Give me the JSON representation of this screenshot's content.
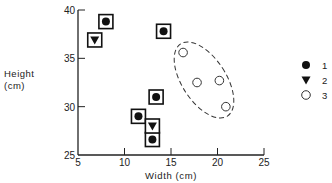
{
  "chart_data": {
    "type": "scatter",
    "title": "",
    "xlabel": "Width (cm)",
    "ylabel": "Height (cm)",
    "ylabel_lines": [
      "Height",
      "(cm)"
    ],
    "xlim": [
      5,
      25
    ],
    "ylim": [
      25,
      40
    ],
    "xticks": [
      5,
      10,
      15,
      20,
      25
    ],
    "yticks": [
      25,
      30,
      35,
      40
    ],
    "grid": false,
    "legend_position": "right",
    "series": [
      {
        "name": "1",
        "marker": "filled-circle",
        "boxed": true,
        "points": [
          [
            8.0,
            38.8
          ],
          [
            14.2,
            37.8
          ],
          [
            13.4,
            31.0
          ],
          [
            11.5,
            29.0
          ],
          [
            13.0,
            26.6
          ]
        ]
      },
      {
        "name": "2",
        "marker": "filled-triangle-down",
        "boxed": true,
        "points": [
          [
            6.8,
            36.9
          ],
          [
            13.0,
            28.0
          ]
        ]
      },
      {
        "name": "3",
        "marker": "open-circle",
        "boxed": false,
        "points": [
          [
            16.3,
            35.6
          ],
          [
            17.8,
            32.5
          ],
          [
            20.2,
            32.7
          ],
          [
            20.9,
            30.0
          ]
        ]
      }
    ],
    "annotations": [
      {
        "type": "dashed-ellipse",
        "encloses_series": "3"
      }
    ]
  },
  "legend": {
    "items": [
      {
        "label": "1",
        "marker": "filled-circle"
      },
      {
        "label": "2",
        "marker": "filled-triangle-down"
      },
      {
        "label": "3",
        "marker": "open-circle"
      }
    ]
  }
}
